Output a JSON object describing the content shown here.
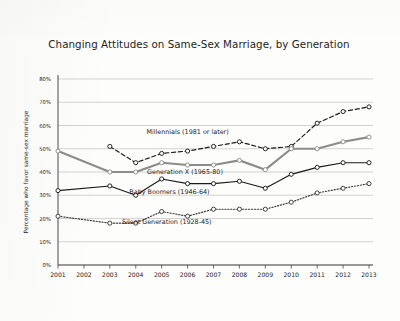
{
  "chart_data": {
    "type": "line",
    "title": "Changing Attitudes on Same-Sex Marriage, by Generation",
    "xlabel": "",
    "ylabel": "Percentage who favor same-sex marriage",
    "x": [
      2001,
      2002,
      2003,
      2004,
      2005,
      2006,
      2007,
      2008,
      2009,
      2010,
      2011,
      2012,
      2013
    ],
    "categories": [
      "2001",
      "2002",
      "2003",
      "2004",
      "2005",
      "2006",
      "2007",
      "2008",
      "2009",
      "2010",
      "2011",
      "2012",
      "2013"
    ],
    "ylim": [
      0,
      80
    ],
    "yticks": [
      0,
      10,
      20,
      30,
      40,
      50,
      60,
      70,
      80
    ],
    "ytick_labels": [
      "0%",
      "10%",
      "20%",
      "30%",
      "40%",
      "50%",
      "60%",
      "70%",
      "80%"
    ],
    "grid": true,
    "legend": "inline-annotations",
    "series": [
      {
        "name": "Millennials  (1981 or later)",
        "label": "Millennials  (1981 or later)",
        "style": "dashed",
        "marker": "open-circle",
        "color": "#1a1a1a",
        "x": [
          2003,
          2004,
          2005,
          2006,
          2007,
          2008,
          2009,
          2010,
          2011,
          2012,
          2013
        ],
        "values": [
          51,
          44,
          48,
          49,
          51,
          53,
          50,
          51,
          61,
          66,
          68
        ]
      },
      {
        "name": "Generation X (1965-80)",
        "label": "Generation X (1965-80)",
        "style": "solid-thick",
        "marker": "open-circle",
        "color": "#8c8c8c",
        "x": [
          2001,
          2003,
          2004,
          2005,
          2006,
          2007,
          2008,
          2009,
          2010,
          2011,
          2012,
          2013
        ],
        "values": [
          49,
          40,
          40,
          44,
          43,
          43,
          45,
          41,
          50,
          50,
          53,
          55
        ]
      },
      {
        "name": "Baby Boomers (1946-64)",
        "label": "Baby Boomers (1946-64)",
        "style": "solid-thin",
        "marker": "open-circle",
        "color": "#1a1a1a",
        "x": [
          2001,
          2003,
          2004,
          2005,
          2006,
          2007,
          2008,
          2009,
          2010,
          2011,
          2012,
          2013
        ],
        "values": [
          32,
          34,
          30,
          37,
          35,
          35,
          36,
          33,
          39,
          42,
          44,
          44
        ]
      },
      {
        "name": "Silent Generation (1928-45)",
        "label": "Silent Generation (1928-45)",
        "style": "dotted",
        "marker": "open-circle",
        "color": "#3a3a3a",
        "x": [
          2001,
          2003,
          2004,
          2005,
          2006,
          2007,
          2008,
          2009,
          2010,
          2011,
          2012,
          2013
        ],
        "values": [
          21,
          18,
          18,
          23,
          21,
          24,
          24,
          24,
          27,
          31,
          33,
          35
        ]
      }
    ],
    "annotations": [
      {
        "text": "Millennials  (1981 or later)",
        "x": 2006.0,
        "y": 56.5
      },
      {
        "text": "Generation X (1965-80)",
        "x": 2005.9,
        "y": 39.0
      },
      {
        "text": "Baby Boomers (1946-64)",
        "x": 2005.3,
        "y": 30.5
      },
      {
        "text": "Silent Generation (1928-45)",
        "x": 2005.2,
        "y": 17.5
      }
    ]
  }
}
